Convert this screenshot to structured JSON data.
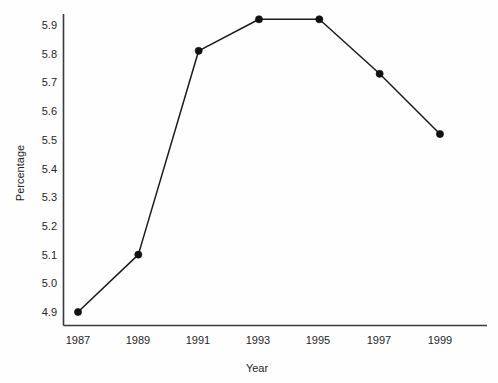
{
  "chart_data": {
    "type": "line",
    "title": "",
    "xlabel": "Year",
    "ylabel": "Percentage",
    "categories": [
      "1987",
      "1989",
      "1991",
      "1993",
      "1995",
      "1997",
      "1999"
    ],
    "x": [
      1987,
      1989,
      1991,
      1993,
      1995,
      1997,
      1999
    ],
    "values": [
      4.9,
      5.1,
      5.81,
      5.92,
      5.92,
      5.73,
      5.52
    ],
    "series": [
      {
        "name": "Percentage",
        "values": [
          4.9,
          5.1,
          5.81,
          5.92,
          5.92,
          5.73,
          5.52
        ],
        "marker": "filled-circle",
        "color": "#111111"
      }
    ],
    "xtick_labels": [
      "1987",
      "1989",
      "1991",
      "1993",
      "1995",
      "1997",
      "1999"
    ],
    "ytick_labels": [
      "4.9",
      "5.0",
      "5.1",
      "5.2",
      "5.3",
      "5.4",
      "5.5",
      "5.6",
      "5.7",
      "5.8",
      "5.9"
    ],
    "ytick_values": [
      4.9,
      5.0,
      5.1,
      5.2,
      5.3,
      5.4,
      5.5,
      5.6,
      5.7,
      5.8,
      5.9
    ],
    "ylim": [
      4.9,
      5.9
    ],
    "xlim": [
      1987,
      1999
    ],
    "grid": false,
    "legend": false,
    "legend_position": "none",
    "line_color": "#111111",
    "axis_color": "#3a3a3a",
    "background_color": "#fefefe"
  },
  "axis_titles": {
    "x": "Year",
    "y": "Percentage"
  }
}
